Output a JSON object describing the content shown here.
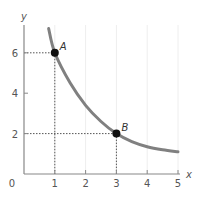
{
  "chart_data": {
    "type": "line",
    "title": "",
    "xlabel": "x",
    "ylabel": "y",
    "xlim": [
      0,
      5
    ],
    "ylim": [
      0,
      7.5
    ],
    "x_ticks": [
      "0",
      "1",
      "2",
      "3",
      "4",
      "5"
    ],
    "y_ticks": [
      "2",
      "4",
      "6"
    ],
    "grid": true,
    "series": [
      {
        "name": "curve",
        "x": [
          0.8,
          1,
          1.5,
          2,
          2.5,
          3,
          3.5,
          4,
          4.5,
          5
        ],
        "y": [
          7.2,
          6,
          4.5,
          3.4,
          2.6,
          2,
          1.6,
          1.35,
          1.2,
          1.1
        ]
      }
    ],
    "points": [
      {
        "label": "A",
        "x": 1,
        "y": 6
      },
      {
        "label": "B",
        "x": 3,
        "y": 2
      }
    ],
    "colors": {
      "curve": "#808080",
      "axis": "#888888",
      "grid": "#eeeeee",
      "point": "#111111"
    }
  }
}
